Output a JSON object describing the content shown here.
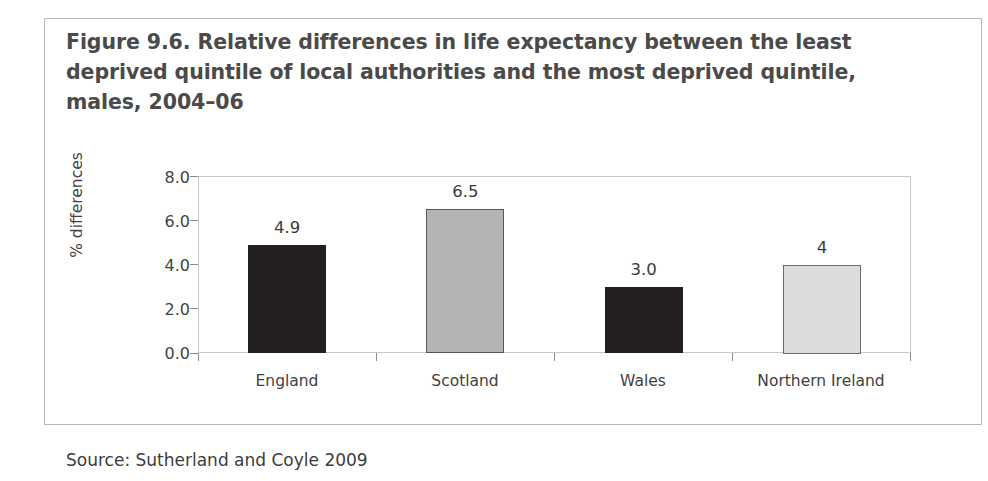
{
  "figure": {
    "title": "Figure 9.6. Relative differences in life expectancy between the least deprived quintile of local authorities and the most deprived quintile, males, 2004–06",
    "source": "Source: Sutherland and Coyle 2009"
  },
  "chart_data": {
    "type": "bar",
    "title": "Figure 9.6. Relative differences in life expectancy between the least deprived quintile of local authorities and the most deprived quintile, males, 2004–06",
    "xlabel": "",
    "ylabel": "% differences",
    "ylim": [
      0.0,
      8.0
    ],
    "ytick_labels": [
      "0.0",
      "2.0",
      "4.0",
      "6.0",
      "8.0"
    ],
    "ytick_values": [
      0.0,
      2.0,
      4.0,
      6.0,
      8.0
    ],
    "grid": false,
    "legend": "none",
    "categories": [
      "England",
      "Scotland",
      "Wales",
      "Northern Ireland"
    ],
    "values": [
      4.9,
      6.5,
      3.0,
      4.0
    ],
    "data_labels": [
      "4.9",
      "6.5",
      "3.0",
      "4"
    ],
    "bar_colors": [
      "#231f20",
      "#b4b4b4",
      "#231f20",
      "#dcdcdc"
    ],
    "bar_edge_colors": [
      "#231f20",
      "#575757",
      "#231f20",
      "#6b6b6b"
    ]
  },
  "colors": {
    "title_text": "#4a4a4a",
    "axis_text": "#444444",
    "frame": "#c8c8c8",
    "box_border": "#b9b9b9",
    "dark_bar": "#231f20",
    "mid_gray_bar": "#b4b4b4",
    "light_gray_bar": "#dcdcdc"
  }
}
